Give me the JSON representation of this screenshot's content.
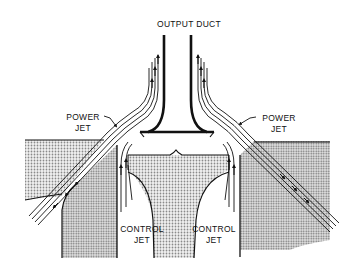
{
  "diagram": {
    "type": "fluidic-amplifier-schematic",
    "labels": {
      "output_duct": "OUTPUT DUCT",
      "power_jet_left_line1": "POWER",
      "power_jet_left_line2": "JET",
      "power_jet_right_line1": "POWER",
      "power_jet_right_line2": "JET",
      "control_jet_left_line1": "CONTROL",
      "control_jet_left_line2": "JET",
      "control_jet_right_line1": "CONTROL",
      "control_jet_right_line2": "JET"
    },
    "colors": {
      "ink": "#111111",
      "fill_light": "#d8d8d8",
      "fill_dark": "#bdbdbd",
      "background": "#ffffff"
    }
  }
}
